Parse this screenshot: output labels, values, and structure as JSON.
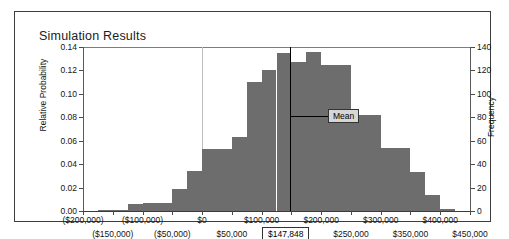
{
  "panel": {
    "title": "Simulation Results"
  },
  "chart_data": {
    "type": "bar",
    "title": "Simulation Results",
    "xlabel": "",
    "ylabel": "Relative Probability",
    "y2label": "Frequency",
    "ylim": [
      0,
      0.14
    ],
    "y2lim": [
      0,
      140
    ],
    "grid": false,
    "legend": null,
    "y_ticks": [
      "0.00",
      "0.02",
      "0.04",
      "0.06",
      "0.08",
      "0.10",
      "0.12",
      "0.14"
    ],
    "y_tick_values": [
      0,
      0.02,
      0.04,
      0.06,
      0.08,
      0.1,
      0.12,
      0.14
    ],
    "y2_ticks": [
      "0",
      "20",
      "40",
      "60",
      "80",
      "100",
      "120",
      "140"
    ],
    "y2_tick_values": [
      0,
      20,
      40,
      60,
      80,
      100,
      120,
      140
    ],
    "x_ticks": [
      "($200,000)",
      "($150,000)",
      "($100,000)",
      "($50,000)",
      "$0",
      "$50,000",
      "$100,000",
      "$150,000",
      "$200,000",
      "$250,000",
      "$300,000",
      "$350,000",
      "$400,000",
      "$450,000"
    ],
    "x_tick_values": [
      -200000,
      -150000,
      -100000,
      -50000,
      0,
      50000,
      100000,
      150000,
      200000,
      250000,
      300000,
      350000,
      400000,
      450000
    ],
    "xlim": [
      -200000,
      450000
    ],
    "bin_width": 25000,
    "bin_starts": [
      -200000,
      -175000,
      -150000,
      -125000,
      -100000,
      -75000,
      -50000,
      -25000,
      0,
      25000,
      50000,
      75000,
      100000,
      125000,
      150000,
      175000,
      200000,
      225000,
      250000,
      275000,
      300000,
      325000,
      350000,
      375000,
      400000,
      425000
    ],
    "values": [
      0.0,
      0.001,
      0.001,
      0.006,
      0.007,
      0.007,
      0.019,
      0.034,
      0.053,
      0.053,
      0.063,
      0.11,
      0.12,
      0.135,
      0.127,
      0.136,
      0.125,
      0.125,
      0.082,
      0.082,
      0.054,
      0.054,
      0.033,
      0.014,
      0.002,
      0.0
    ],
    "frequencies": [
      0,
      1,
      1,
      6,
      7,
      7,
      19,
      34,
      53,
      53,
      63,
      110,
      120,
      135,
      127,
      136,
      125,
      125,
      82,
      82,
      54,
      54,
      33,
      14,
      2,
      0
    ],
    "annotations": [
      {
        "name": "mean",
        "label": "Mean",
        "value_label": "$147,848",
        "value": 147848
      }
    ],
    "bar_color": "#6d6d6d"
  }
}
